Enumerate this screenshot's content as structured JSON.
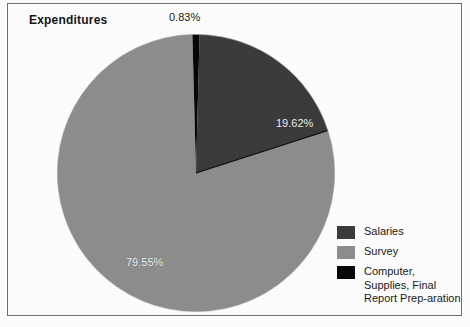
{
  "figure": {
    "title": "Expenditures",
    "frame_border_color": "#6f6f6f",
    "background_color": "#fdfdfd"
  },
  "chart_data": {
    "type": "pie",
    "title": "Expenditures",
    "categories": [
      "Salaries",
      "Survey",
      "Computer, Supplies, Final Report Preparation"
    ],
    "values": [
      19.62,
      79.55,
      0.83
    ],
    "value_labels": [
      "19.62%",
      "79.55%",
      "0.83%"
    ],
    "unit": "percent",
    "colors": [
      "#3b3b3b",
      "#8d8d8d",
      "#070707"
    ],
    "start_angle_deg": 0,
    "direction": "clockwise",
    "legend_position": "bottom-right",
    "slice_label_colors": [
      "#f2f2f2",
      "#f2f2f2",
      "#1a1a1a"
    ],
    "separator_color": "#070707"
  },
  "legend": {
    "items": [
      {
        "label": "Salaries",
        "color": "#3b3b3b"
      },
      {
        "label": "Survey",
        "color": "#8d8d8d"
      },
      {
        "label": "Computer, Supplies, Final Report Prep-aration",
        "color": "#070707"
      }
    ]
  },
  "labels": {
    "salaries_pct": "19.62%",
    "survey_pct": "79.55%",
    "computer_pct": "0.83%"
  }
}
